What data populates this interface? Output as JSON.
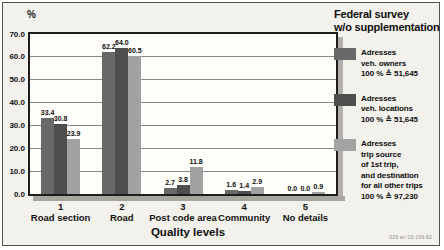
{
  "figure": {
    "percent_label": "%",
    "xlabel": "Quality levels",
    "footnote": "029 an 03-159-92"
  },
  "legend": {
    "title_lines": [
      "Federal survey",
      "w/o supplementation"
    ],
    "entries": [
      {
        "lines": [
          "Adresses",
          "veh. owners",
          "100 % ≙ 51,645"
        ]
      },
      {
        "lines": [
          "Adresses",
          "veh. locations",
          "100 % ≙ 51,645"
        ]
      },
      {
        "lines": [
          "Adresses",
          "trip source",
          "of 1st trip,",
          "and destination",
          "for all other trips",
          "100 % ≙ 97,230"
        ]
      }
    ]
  },
  "chart_data": {
    "type": "bar",
    "title": "Federal survey w/o supplementation",
    "xlabel": "Quality levels",
    "ylabel": "%",
    "ylim": [
      0,
      70
    ],
    "ytick_step": 10,
    "ytick_labels": [
      "0.0",
      "10.0",
      "20.0",
      "30.0",
      "40.0",
      "50.0",
      "60.0",
      "70.0"
    ],
    "grid": true,
    "legend_position": "right",
    "categories": [
      {
        "number": "1",
        "label": "Road section"
      },
      {
        "number": "2",
        "label": "Road"
      },
      {
        "number": "3",
        "label": "Post code area"
      },
      {
        "number": "4",
        "label": "Community"
      },
      {
        "number": "5",
        "label": "No details"
      }
    ],
    "series": [
      {
        "name": "Adresses veh. owners 100 % ≙ 51,645",
        "color": "#696969",
        "values": [
          33.4,
          62.2,
          2.7,
          1.6,
          0.0
        ]
      },
      {
        "name": "Adresses veh. locations 100 % ≙ 51,645",
        "color": "#4e4e4e",
        "values": [
          30.8,
          64.0,
          3.8,
          1.4,
          0.0
        ]
      },
      {
        "name": "Adresses trip source of 1st trip, and destination for all other trips 100 % ≙ 97,230",
        "color": "#a2a2a2",
        "values": [
          23.9,
          60.5,
          11.8,
          2.9,
          0.9
        ]
      }
    ]
  }
}
